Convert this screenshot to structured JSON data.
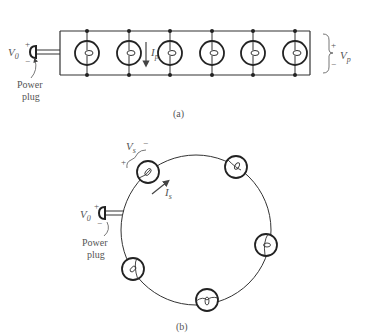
{
  "figure_a": {
    "caption": "(a)",
    "source_label": "V",
    "source_sub": "0",
    "plug_label_line1": "Power",
    "plug_label_line2": "plug",
    "current_label": "I",
    "current_sub": "p",
    "voltage_label": "V",
    "voltage_sub": "p",
    "plus": "+",
    "minus": "−",
    "bulb_count": 6
  },
  "figure_b": {
    "caption": "(b)",
    "source_label": "V",
    "source_sub": "0",
    "plug_label_line1": "Power",
    "plug_label_line2": "plug",
    "current_label": "I",
    "current_sub": "s",
    "voltage_label": "V",
    "voltage_sub": "s",
    "plus": "+",
    "minus": "−",
    "bulb_count": 5
  }
}
